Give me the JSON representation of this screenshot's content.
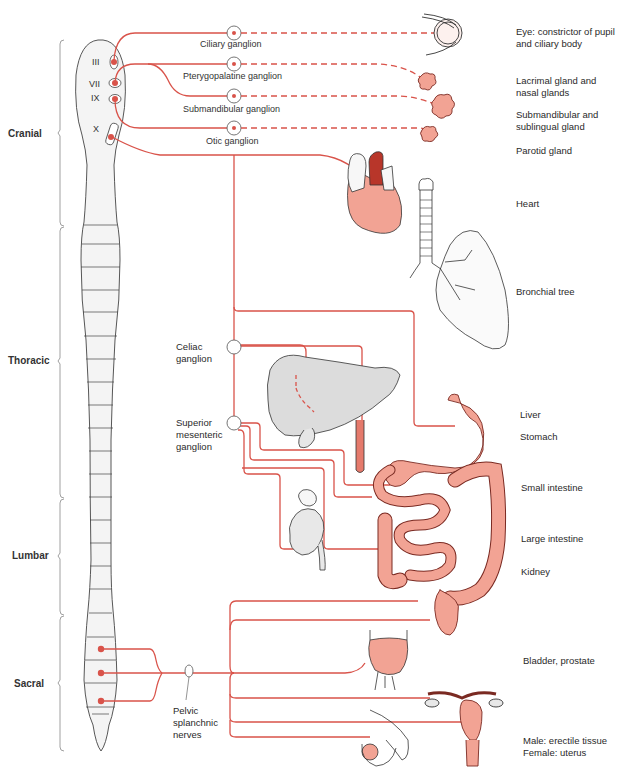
{
  "figure": {
    "type": "parasympathetic nervous system anatomical diagram",
    "colors": {
      "nerve": "#d9534a",
      "organ_fill": "#f2a394",
      "organ_dark": "#c0392b",
      "cord_fill": "#f4f4f4",
      "outline": "#444444"
    }
  },
  "regions": [
    {
      "label": "Cranial"
    },
    {
      "label": "Thoracic"
    },
    {
      "label": "Lumbar"
    },
    {
      "label": "Sacral"
    }
  ],
  "cranial_nerves": [
    {
      "label": "III"
    },
    {
      "label": "VII"
    },
    {
      "label": "IX"
    },
    {
      "label": "X"
    }
  ],
  "ganglia": [
    {
      "label": "Ciliary ganglion"
    },
    {
      "label": "Pterygopalatine ganglion"
    },
    {
      "label": "Submandibular ganglion"
    },
    {
      "label": "Otic ganglion"
    },
    {
      "label": "Celiac\nganglion"
    },
    {
      "label": "Superior\nmesenteric\nganglion"
    },
    {
      "label": "Pelvic\nsplanchnic\nnerves"
    }
  ],
  "targets": [
    {
      "label": "Eye: constrictor of pupil\nand ciliary body"
    },
    {
      "label": "Lacrimal gland and\nnasal glands"
    },
    {
      "label": "Submandibular and\nsublingual gland"
    },
    {
      "label": "Parotid gland"
    },
    {
      "label": "Heart"
    },
    {
      "label": "Bronchial tree"
    },
    {
      "label": "Liver"
    },
    {
      "label": "Stomach"
    },
    {
      "label": "Small intestine"
    },
    {
      "label": "Large intestine"
    },
    {
      "label": "Kidney"
    },
    {
      "label": "Bladder, prostate"
    },
    {
      "label": "Male: erectile tissue\nFemale: uterus"
    }
  ]
}
